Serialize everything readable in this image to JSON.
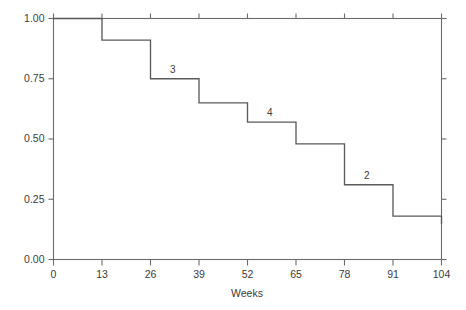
{
  "chart_data": {
    "type": "line",
    "subtype": "kaplan-meier-step",
    "title": "",
    "xlabel": "Weeks",
    "ylabel": "",
    "xlim": [
      0,
      104
    ],
    "ylim": [
      0.0,
      1.0
    ],
    "grid": false,
    "legend": "none",
    "xticks": [
      0,
      13,
      26,
      39,
      52,
      65,
      78,
      91,
      104
    ],
    "xticklabels": [
      "0",
      "13",
      "26",
      "39",
      "52",
      "65",
      "78",
      "91",
      "104"
    ],
    "yticks": [
      0.0,
      0.25,
      0.5,
      0.75,
      1.0
    ],
    "yticklabels": [
      "0.00",
      "0.25",
      "0.50",
      "0.75",
      "1.00"
    ],
    "series": [
      {
        "name": "Survival probability",
        "x": [
          0,
          13,
          26,
          39,
          52,
          65,
          78,
          91,
          104
        ],
        "values": [
          1.0,
          0.91,
          0.75,
          0.65,
          0.57,
          0.48,
          0.31,
          0.18,
          0.18
        ]
      }
    ],
    "steps": [
      {
        "from": 0,
        "to": 13,
        "y": 1.0
      },
      {
        "from": 13,
        "to": 26,
        "y": 0.91
      },
      {
        "from": 26,
        "to": 39,
        "y": 0.75
      },
      {
        "from": 39,
        "to": 52,
        "y": 0.65
      },
      {
        "from": 52,
        "to": 65,
        "y": 0.57
      },
      {
        "from": 65,
        "to": 78,
        "y": 0.48
      },
      {
        "from": 78,
        "to": 91,
        "y": 0.31
      },
      {
        "from": 91,
        "to": 104,
        "y": 0.18
      }
    ],
    "annotations": [
      {
        "label": "3",
        "x": 32,
        "y": 0.75
      },
      {
        "label": "4",
        "x": 58,
        "y": 0.57
      },
      {
        "label": "2",
        "x": 84,
        "y": 0.31
      }
    ],
    "colors": {
      "line": "#5a5a5a",
      "axis": "#6b6b6b",
      "text": "#3c3c3c",
      "background": "#ffffff"
    }
  },
  "caption": {
    "text": ""
  }
}
